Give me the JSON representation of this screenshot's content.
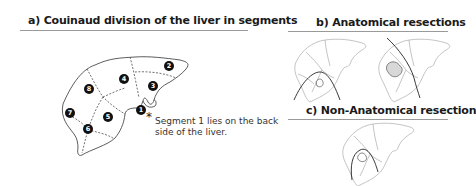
{
  "panels": {
    "a": {
      "title": "a) Couinaud division of the liver in segments",
      "segments": [
        {
          "id": "1",
          "label": "1"
        },
        {
          "id": "2",
          "label": "2"
        },
        {
          "id": "3",
          "label": "3"
        },
        {
          "id": "4",
          "label": "4"
        },
        {
          "id": "5",
          "label": "5"
        },
        {
          "id": "6",
          "label": "6"
        },
        {
          "id": "7",
          "label": "7"
        },
        {
          "id": "8",
          "label": "8"
        }
      ],
      "note_star": "*",
      "note_line1": "Segment 1 lies on the back",
      "note_line2": "side of the liver."
    },
    "b": {
      "title": "b) Anatomical resections"
    },
    "c": {
      "title": "c) Non-Anatomical resection"
    }
  },
  "colors": {
    "outline_main": "#333333",
    "outline_light": "#aaaaaa",
    "badge": "#111111",
    "rule": "#9a9a9a",
    "resection_line": "#222222"
  }
}
